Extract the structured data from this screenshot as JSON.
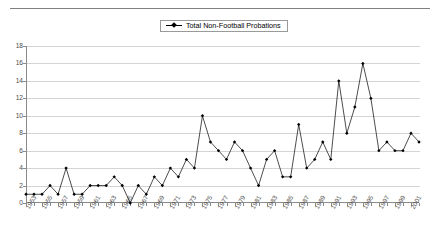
{
  "legend": {
    "label": "Total Non-Football Probations",
    "marker_icon": "diamond-marker-icon",
    "position": "top-center"
  },
  "axes": {
    "y_ticks": [
      "0",
      "2",
      "4",
      "6",
      "8",
      "10",
      "12",
      "14",
      "16",
      "18"
    ],
    "y_min": 0,
    "y_max": 18,
    "y_step": 2,
    "x_tick_labels": [
      "1953",
      "1955",
      "1957",
      "1959",
      "1961",
      "1963",
      "1965",
      "1967",
      "1969",
      "1971",
      "1973",
      "1975",
      "1977",
      "1979",
      "1981",
      "1983",
      "1985",
      "1987",
      "1989",
      "1991",
      "1993",
      "1995",
      "1997",
      "1999",
      "2001"
    ]
  },
  "colors": {
    "series": "#000000",
    "grid": "#d4d4d4",
    "axis": "#8a8a8a",
    "text": "#4a4a4a",
    "background": "#ffffff"
  },
  "chart_data": {
    "type": "line",
    "title": "",
    "subtitle": "",
    "xlabel": "",
    "ylabel": "",
    "ylim": [
      0,
      18
    ],
    "grid": true,
    "legend_position": "top-center",
    "x": [
      1953,
      1954,
      1955,
      1956,
      1957,
      1958,
      1959,
      1960,
      1961,
      1962,
      1963,
      1964,
      1965,
      1966,
      1967,
      1968,
      1969,
      1970,
      1971,
      1972,
      1973,
      1974,
      1975,
      1976,
      1977,
      1978,
      1979,
      1980,
      1981,
      1982,
      1983,
      1984,
      1985,
      1986,
      1987,
      1988,
      1989,
      1990,
      1991,
      1992,
      1993,
      1994,
      1995,
      1996,
      1997,
      1998,
      1999,
      2000,
      2001,
      2002
    ],
    "series": [
      {
        "name": "Total Non-Football Probations",
        "values": [
          1,
          1,
          1,
          2,
          1,
          4,
          1,
          1,
          2,
          2,
          2,
          3,
          2,
          0,
          2,
          1,
          3,
          2,
          4,
          3,
          5,
          4,
          10,
          7,
          6,
          5,
          7,
          6,
          4,
          2,
          5,
          6,
          3,
          3,
          9,
          4,
          5,
          7,
          5,
          14,
          8,
          11,
          16,
          12,
          6,
          7,
          6,
          6,
          8,
          7
        ]
      }
    ]
  }
}
